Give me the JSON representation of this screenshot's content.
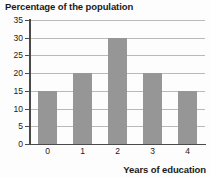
{
  "chart_data": {
    "type": "bar",
    "title": "Percentage of the population",
    "xlabel": "Years of education",
    "ylabel": "",
    "categories": [
      "0",
      "1",
      "2",
      "3",
      "4"
    ],
    "values": [
      15,
      20,
      30,
      20,
      15
    ],
    "ylim": [
      0,
      35
    ],
    "ytick_labels": [
      "0",
      "5",
      "10",
      "15",
      "20",
      "25",
      "30",
      "35"
    ],
    "ytick_values": [
      0,
      5,
      10,
      15,
      20,
      25,
      30,
      35
    ],
    "grid": true,
    "legend": null,
    "bar_color": "#969696",
    "grid_color": "#b9b9b9",
    "axis_color": "#4a4a4a",
    "background_color": "#fdfdfd"
  }
}
